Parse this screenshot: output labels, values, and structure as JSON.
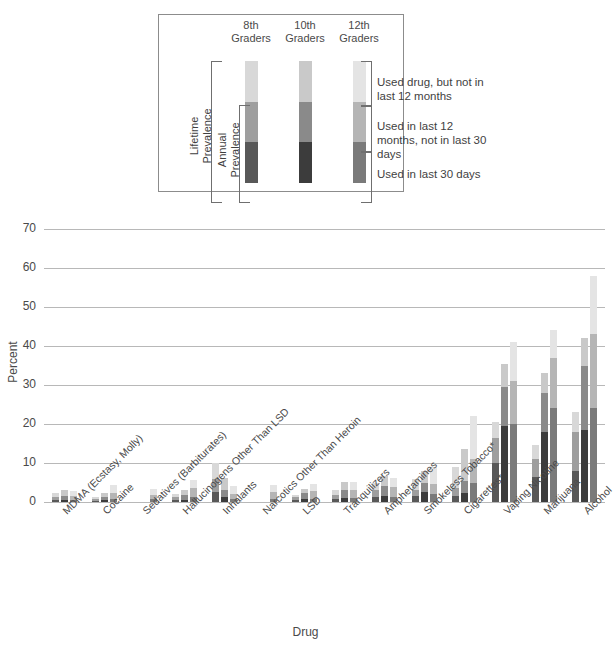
{
  "legend": {
    "title_headers": [
      "8th\nGraders",
      "10th\nGraders",
      "12th\nGraders"
    ],
    "header_8": "8th Graders",
    "header_10": "10th Graders",
    "header_12": "12th Graders",
    "bracket_lifetime": "Lifetime Prevalence",
    "bracket_annual": "Annual Prevalence",
    "text_lifetime": "Used drug, but not in last 12 months",
    "text_annual": "Used in last 12 months, not in last 30 days",
    "text_30day": "Used in last 30 days"
  },
  "colors": {
    "last_30_days": "#585858",
    "last_12_months": "#9e9e9e",
    "lifetime_only": "#d8d8d8",
    "gridline": "#b8b8b8",
    "text": "#4a4a4a",
    "legend_border": "#8c8c8c"
  },
  "chart_data": {
    "type": "bar",
    "title": "",
    "xlabel": "Drug",
    "ylabel": "Percent",
    "ylim": [
      0,
      70
    ],
    "yticks": [
      0,
      10,
      20,
      30,
      40,
      50,
      60,
      70
    ],
    "grid": true,
    "stacked": true,
    "legend_position": "top-center-inset",
    "group_labels": [
      "8th Graders",
      "10th Graders",
      "12th Graders"
    ],
    "segment_names": [
      "Used in last 30 days",
      "Used in last 12 months, not in last 30 days",
      "Used drug, but not in last 12 months"
    ],
    "categories": [
      "MDMA (Ecstasy, Molly)",
      "Cocaine",
      "Sedatives (Barbiturates)",
      "Hallucinogens Other Than LSD",
      "Inhalants",
      "Narcotics Other Than Heroin",
      "LSD",
      "Tranquilizers",
      "Amphetamines",
      "Smokeless Tobacco*",
      "Cigarettes*",
      "Vaping Nicotine",
      "Marijuana",
      "Alcohol"
    ],
    "groups": [
      {
        "category": "MDMA (Ecstasy, Molly)",
        "bars": [
          {
            "grade": "8th",
            "last_30_days": 0.6,
            "last_12_months": 0.8,
            "lifetime_only": 0.8,
            "lifetime_total": 2.2
          },
          {
            "grade": "10th",
            "last_30_days": 0.6,
            "last_12_months": 1.0,
            "lifetime_only": 1.5,
            "lifetime_total": 3.1
          },
          {
            "grade": "12th",
            "last_30_days": 0.6,
            "last_12_months": 1.0,
            "lifetime_only": 1.1,
            "lifetime_total": 2.7
          }
        ]
      },
      {
        "category": "Cocaine",
        "bars": [
          {
            "grade": "8th",
            "last_30_days": 0.3,
            "last_12_months": 0.5,
            "lifetime_only": 0.4,
            "lifetime_total": 1.2
          },
          {
            "grade": "10th",
            "last_30_days": 0.4,
            "last_12_months": 0.8,
            "lifetime_only": 1.0,
            "lifetime_total": 2.2
          },
          {
            "grade": "12th",
            "last_30_days": 0.8,
            "last_12_months": 1.6,
            "lifetime_only": 1.9,
            "lifetime_total": 4.3
          }
        ]
      },
      {
        "category": "Sedatives (Barbiturates)",
        "bars": [
          {
            "grade": "8th",
            "last_30_days": 0.0,
            "last_12_months": 0.0,
            "lifetime_only": 0.0,
            "lifetime_total": 0.0
          },
          {
            "grade": "10th",
            "last_30_days": 0.0,
            "last_12_months": 0.0,
            "lifetime_only": 0.0,
            "lifetime_total": 0.0
          },
          {
            "grade": "12th",
            "last_30_days": 0.7,
            "last_12_months": 1.2,
            "lifetime_only": 1.5,
            "lifetime_total": 3.4
          }
        ]
      },
      {
        "category": "Hallucinogens Other Than LSD",
        "bars": [
          {
            "grade": "8th",
            "last_30_days": 0.5,
            "last_12_months": 0.8,
            "lifetime_only": 0.7,
            "lifetime_total": 2.0
          },
          {
            "grade": "10th",
            "last_30_days": 0.6,
            "last_12_months": 1.3,
            "lifetime_only": 1.3,
            "lifetime_total": 3.2
          },
          {
            "grade": "12th",
            "last_30_days": 1.2,
            "last_12_months": 2.4,
            "lifetime_only": 2.0,
            "lifetime_total": 5.6
          }
        ]
      },
      {
        "category": "Inhalants",
        "bars": [
          {
            "grade": "8th",
            "last_30_days": 2.5,
            "last_12_months": 3.5,
            "lifetime_only": 4.0,
            "lifetime_total": 10.0
          },
          {
            "grade": "10th",
            "last_30_days": 1.2,
            "last_12_months": 2.0,
            "lifetime_only": 3.0,
            "lifetime_total": 6.2
          },
          {
            "grade": "12th",
            "last_30_days": 0.8,
            "last_12_months": 1.2,
            "lifetime_only": 2.0,
            "lifetime_total": 4.0
          }
        ]
      },
      {
        "category": "Narcotics Other Than Heroin",
        "bars": [
          {
            "grade": "8th",
            "last_30_days": 0.0,
            "last_12_months": 0.0,
            "lifetime_only": 0.0,
            "lifetime_total": 0.0
          },
          {
            "grade": "10th",
            "last_30_days": 0.0,
            "last_12_months": 0.0,
            "lifetime_only": 0.0,
            "lifetime_total": 0.0
          },
          {
            "grade": "12th",
            "last_30_days": 0.9,
            "last_12_months": 1.7,
            "lifetime_only": 1.7,
            "lifetime_total": 4.3
          }
        ]
      },
      {
        "category": "LSD",
        "bars": [
          {
            "grade": "8th",
            "last_30_days": 0.4,
            "last_12_months": 0.8,
            "lifetime_only": 0.6,
            "lifetime_total": 1.8
          },
          {
            "grade": "10th",
            "last_30_days": 0.7,
            "last_12_months": 1.5,
            "lifetime_only": 1.2,
            "lifetime_total": 3.4
          },
          {
            "grade": "12th",
            "last_30_days": 0.9,
            "last_12_months": 1.9,
            "lifetime_only": 1.7,
            "lifetime_total": 4.5
          }
        ]
      },
      {
        "category": "Tranquilizers",
        "bars": [
          {
            "grade": "8th",
            "last_30_days": 0.7,
            "last_12_months": 1.1,
            "lifetime_only": 1.2,
            "lifetime_total": 3.0
          },
          {
            "grade": "10th",
            "last_30_days": 1.0,
            "last_12_months": 2.0,
            "lifetime_only": 2.2,
            "lifetime_total": 5.2
          },
          {
            "grade": "12th",
            "last_30_days": 1.1,
            "last_12_months": 2.0,
            "lifetime_only": 2.0,
            "lifetime_total": 5.1
          }
        ]
      },
      {
        "category": "Amphetamines",
        "bars": [
          {
            "grade": "8th",
            "last_30_days": 1.2,
            "last_12_months": 2.0,
            "lifetime_only": 1.8,
            "lifetime_total": 5.0
          },
          {
            "grade": "10th",
            "last_30_days": 1.6,
            "last_12_months": 2.6,
            "lifetime_only": 2.6,
            "lifetime_total": 6.8
          },
          {
            "grade": "12th",
            "last_30_days": 1.4,
            "last_12_months": 2.4,
            "lifetime_only": 2.4,
            "lifetime_total": 6.2
          }
        ]
      },
      {
        "category": "Smokeless Tobacco*",
        "bars": [
          {
            "grade": "8th",
            "last_30_days": 1.6,
            "last_12_months": 1.6,
            "lifetime_only": 2.8,
            "lifetime_total": 6.0
          },
          {
            "grade": "10th",
            "last_30_days": 2.6,
            "last_12_months": 2.2,
            "lifetime_only": 3.2,
            "lifetime_total": 8.0
          },
          {
            "grade": "12th",
            "last_30_days": 2.0,
            "last_12_months": 2.5,
            "lifetime_only": 4.5,
            "lifetime_total": 9.0
          }
        ]
      },
      {
        "category": "Cigarettes*",
        "bars": [
          {
            "grade": "8th",
            "last_30_days": 1.5,
            "last_12_months": 2.0,
            "lifetime_only": 5.5,
            "lifetime_total": 9.0
          },
          {
            "grade": "10th",
            "last_30_days": 2.3,
            "last_12_months": 3.2,
            "lifetime_only": 8.0,
            "lifetime_total": 13.5
          },
          {
            "grade": "12th",
            "last_30_days": 5.0,
            "last_12_months": 6.0,
            "lifetime_only": 11.0,
            "lifetime_total": 22.0
          }
        ]
      },
      {
        "category": "Vaping Nicotine",
        "bars": [
          {
            "grade": "8th",
            "last_30_days": 10.0,
            "last_12_months": 6.5,
            "lifetime_only": 4.0,
            "lifetime_total": 20.5
          },
          {
            "grade": "10th",
            "last_30_days": 19.5,
            "last_12_months": 10.0,
            "lifetime_only": 6.0,
            "lifetime_total": 35.5
          },
          {
            "grade": "12th",
            "last_30_days": 20.0,
            "last_12_months": 11.0,
            "lifetime_only": 10.0,
            "lifetime_total": 41.0
          }
        ]
      },
      {
        "category": "Marijuana",
        "bars": [
          {
            "grade": "8th",
            "last_30_days": 6.5,
            "last_12_months": 4.5,
            "lifetime_only": 3.5,
            "lifetime_total": 14.5
          },
          {
            "grade": "10th",
            "last_30_days": 18.0,
            "last_12_months": 10.0,
            "lifetime_only": 5.0,
            "lifetime_total": 33.0
          },
          {
            "grade": "12th",
            "last_30_days": 24.0,
            "last_12_months": 13.0,
            "lifetime_only": 7.0,
            "lifetime_total": 44.0
          }
        ]
      },
      {
        "category": "Alcohol",
        "bars": [
          {
            "grade": "8th",
            "last_30_days": 8.0,
            "last_12_months": 10.0,
            "lifetime_only": 5.0,
            "lifetime_total": 23.0
          },
          {
            "grade": "10th",
            "last_30_days": 18.5,
            "last_12_months": 16.5,
            "lifetime_only": 7.0,
            "lifetime_total": 42.0
          },
          {
            "grade": "12th",
            "last_30_days": 24.0,
            "last_12_months": 19.0,
            "lifetime_only": 15.0,
            "lifetime_total": 58.0
          }
        ]
      }
    ]
  }
}
